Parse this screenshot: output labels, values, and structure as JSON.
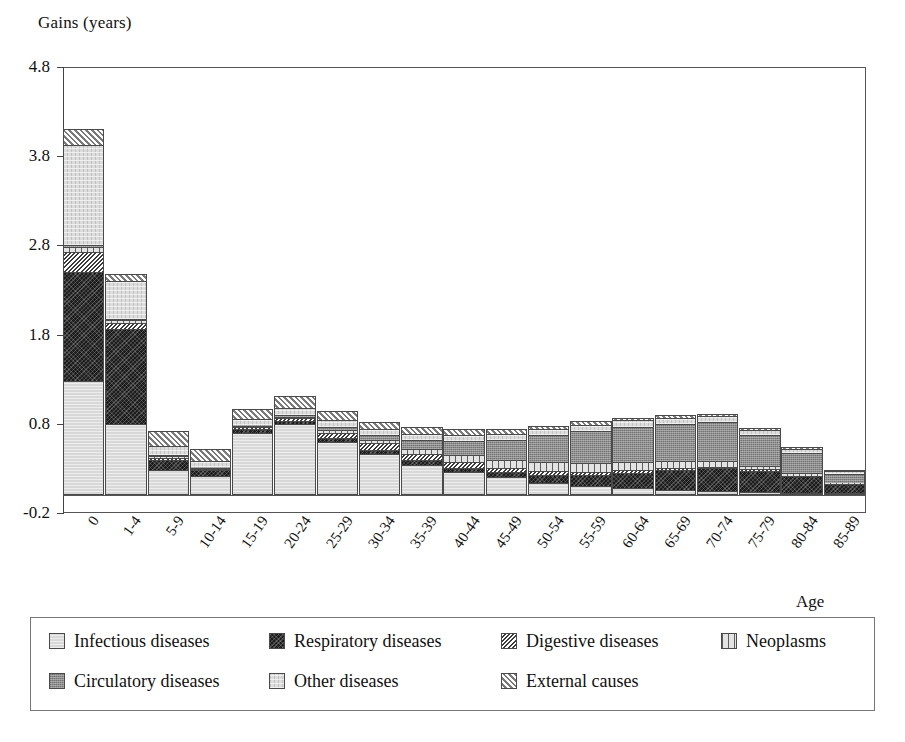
{
  "chart_data": {
    "type": "bar",
    "stacked": true,
    "title": "",
    "ylabel": "Gains (years)",
    "xlabel": "Age",
    "ylim": [
      -0.2,
      4.8
    ],
    "yticks": [
      "4.8",
      "3.8",
      "2.8",
      "1.8",
      "0.8",
      "-0.2"
    ],
    "ytick_values": [
      4.8,
      3.8,
      2.8,
      1.8,
      0.8,
      -0.2
    ],
    "grid": false,
    "legend_position": "bottom",
    "categories": [
      "0",
      "1-4",
      "5-9",
      "10-14",
      "15-19",
      "20-24",
      "25-29",
      "30-34",
      "35-39",
      "40-44",
      "45-49",
      "50-54",
      "55-59",
      "60-64",
      "65-69",
      "70-74",
      "75-79",
      "80-84",
      "85-89"
    ],
    "series": [
      {
        "name": "Infectious diseases",
        "pattern": "p-infectious",
        "color": "#d8d8d8",
        "values": [
          1.28,
          0.8,
          0.28,
          0.22,
          0.7,
          0.8,
          0.6,
          0.46,
          0.34,
          0.26,
          0.2,
          0.14,
          0.1,
          0.08,
          0.06,
          0.05,
          0.04,
          0.03,
          0.02
        ]
      },
      {
        "name": "Respiratory diseases",
        "pattern": "p-respiratory",
        "color": "#1d1d1d",
        "values": [
          1.22,
          1.06,
          0.12,
          0.06,
          0.04,
          0.03,
          0.04,
          0.05,
          0.05,
          0.05,
          0.06,
          0.09,
          0.13,
          0.17,
          0.22,
          0.25,
          0.23,
          0.18,
          0.1
        ]
      },
      {
        "name": "Digestive diseases",
        "pattern": "p-digestive",
        "color": "#9a9a9a",
        "values": [
          0.23,
          0.07,
          0.02,
          0.01,
          0.02,
          0.03,
          0.06,
          0.07,
          0.07,
          0.06,
          0.05,
          0.04,
          0.03,
          0.03,
          0.02,
          0.02,
          0.02,
          0.01,
          0.01
        ]
      },
      {
        "name": "Neoplasms",
        "pattern": "p-neoplasms",
        "color": "#e3e3e3",
        "values": [
          0.05,
          0.03,
          0.02,
          0.02,
          0.02,
          0.02,
          0.03,
          0.04,
          0.06,
          0.08,
          0.09,
          0.1,
          0.1,
          0.09,
          0.08,
          0.06,
          0.04,
          0.03,
          0.01
        ]
      },
      {
        "name": "Circulatory diseases",
        "pattern": "p-circulatory",
        "color": "#8c8c8c",
        "values": [
          0.03,
          0.02,
          0.01,
          0.01,
          0.01,
          0.02,
          0.03,
          0.05,
          0.1,
          0.16,
          0.22,
          0.3,
          0.36,
          0.4,
          0.42,
          0.44,
          0.34,
          0.22,
          0.1
        ]
      },
      {
        "name": "Other diseases",
        "pattern": "p-other",
        "color": "#dcdcdc",
        "values": [
          1.12,
          0.42,
          0.1,
          0.06,
          0.06,
          0.08,
          0.08,
          0.07,
          0.07,
          0.07,
          0.07,
          0.07,
          0.07,
          0.07,
          0.07,
          0.07,
          0.06,
          0.05,
          0.03
        ]
      },
      {
        "name": "External causes",
        "pattern": "p-external",
        "color": "#cfcfcf",
        "values": [
          0.17,
          0.08,
          0.17,
          0.14,
          0.12,
          0.13,
          0.1,
          0.08,
          0.07,
          0.06,
          0.05,
          0.04,
          0.04,
          0.03,
          0.03,
          0.02,
          0.02,
          0.02,
          0.01
        ]
      }
    ],
    "totals": [
      4.1,
      2.48,
      0.72,
      0.52,
      0.97,
      1.11,
      0.94,
      0.82,
      0.76,
      0.74,
      0.74,
      0.78,
      0.83,
      0.87,
      0.9,
      0.91,
      0.75,
      0.54,
      0.28
    ]
  },
  "legend": {
    "rows": [
      [
        {
          "label": "Infectious diseases",
          "pattern": "p-infectious"
        },
        {
          "label": "Respiratory diseases",
          "pattern": "p-respiratory"
        },
        {
          "label": "Digestive diseases",
          "pattern": "p-digestive"
        },
        {
          "label": "Neoplasms",
          "pattern": "p-neoplasms"
        }
      ],
      [
        {
          "label": "Circulatory diseases",
          "pattern": "p-circulatory"
        },
        {
          "label": "Other diseases",
          "pattern": "p-other"
        },
        {
          "label": "External causes",
          "pattern": "p-external"
        }
      ]
    ]
  }
}
